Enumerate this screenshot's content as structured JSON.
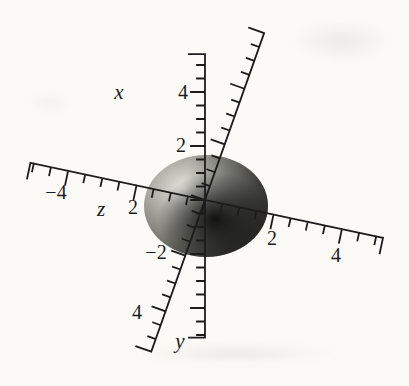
{
  "chart_data": {
    "type": "3d-coordinate-plot",
    "description": "Grayscale shaded sphere of radius 2 centered at the origin of a 3D coordinate system with ruler-style tick marks on the x, y and z axes",
    "sphere": {
      "radius": 2,
      "center_x": 0,
      "center_y": 0,
      "center_z": 0
    },
    "axes": [
      {
        "id": "x",
        "letter": "x",
        "orientation": "vertical, positive up",
        "visible_range": [
          -5.1,
          5.4
        ],
        "minor_tick_step": 0.5,
        "major_tick_step": 2,
        "labeled_ticks": [
          4,
          2,
          -2
        ]
      },
      {
        "id": "y",
        "letter": "y",
        "orientation": "steep diagonal from upper right to lower left",
        "visible_range": [
          -5.45,
          6.0
        ],
        "minor_tick_step": 0.5,
        "major_tick_step": 2,
        "labeled_ticks": [
          4
        ]
      },
      {
        "id": "z",
        "letter": "z",
        "orientation": "shallow diagonal from upper left to lower right",
        "visible_range": [
          -5.1,
          5.2
        ],
        "minor_tick_step": 0.5,
        "major_tick_step": 2,
        "labeled_ticks": [
          2,
          -4,
          2,
          4
        ]
      }
    ],
    "labels": [
      {
        "text": "x",
        "kind": "axis-letter",
        "axis": "x"
      },
      {
        "text": "4",
        "kind": "tick-label",
        "axis": "x"
      },
      {
        "text": "2",
        "kind": "tick-label",
        "axis": "x"
      },
      {
        "text": "−2",
        "kind": "tick-label",
        "axis": "x"
      },
      {
        "text": "y",
        "kind": "axis-letter",
        "axis": "y"
      },
      {
        "text": "4",
        "kind": "tick-label",
        "axis": "y"
      },
      {
        "text": "z",
        "kind": "axis-letter",
        "axis": "z"
      },
      {
        "text": "2",
        "kind": "tick-label",
        "axis": "z"
      },
      {
        "text": "−4",
        "kind": "tick-label",
        "axis": "z"
      },
      {
        "text": "2",
        "kind": "tick-label",
        "axis": "z"
      },
      {
        "text": "4",
        "kind": "tick-label",
        "axis": "z"
      }
    ],
    "colors": {
      "ink": "#1c1c1c",
      "background": "#fbfaf7",
      "sphere_highlight": "#e8e8e0",
      "sphere_mid": "#9a9a93",
      "sphere_shadow": "#0a0a0a"
    }
  }
}
